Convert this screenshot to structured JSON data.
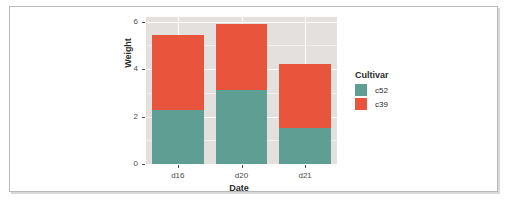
{
  "chart_data": {
    "type": "bar",
    "stacked": true,
    "title": "",
    "xlabel": "Date",
    "ylabel": "Weight",
    "categories": [
      "d16",
      "d20",
      "d21"
    ],
    "series": [
      {
        "name": "c52",
        "color": "#5f9e92",
        "values": [
          2.26,
          3.11,
          1.5
        ]
      },
      {
        "name": "c39",
        "color": "#e8553c",
        "values": [
          3.18,
          2.79,
          2.7
        ]
      }
    ],
    "totals": [
      5.44,
      5.9,
      4.2
    ],
    "ylim": [
      0,
      6.2
    ],
    "y_ticks": [
      0,
      2,
      4,
      6
    ],
    "y_tick_labels": [
      "0",
      "2",
      "4",
      "6"
    ],
    "x_tick_labels": [
      "d16",
      "d20",
      "d21"
    ],
    "grid": true,
    "legend": {
      "title": "Cultivar",
      "position": "right",
      "entries": [
        {
          "label": "c52",
          "color": "#5f9e92"
        },
        {
          "label": "c39",
          "color": "#e8553c"
        }
      ]
    },
    "panel_background": "#e3e0dd",
    "gridline_color": "#ffffff",
    "page_background": "#ffffff"
  }
}
